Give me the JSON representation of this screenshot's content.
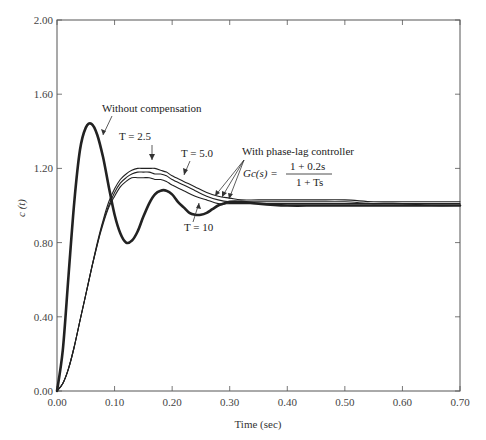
{
  "chart_data": {
    "type": "line",
    "title": "",
    "xlabel": "Time (sec)",
    "ylabel": "c (t)",
    "xlim": [
      0.0,
      0.7
    ],
    "ylim": [
      0.0,
      2.0
    ],
    "grid": false,
    "x_ticks": [
      "0.00",
      "0.10",
      "0.20",
      "0.30",
      "0.40",
      "0.50",
      "0.60",
      "0.70"
    ],
    "y_ticks": [
      "0.00",
      "0.40",
      "0.80",
      "1.20",
      "1.60",
      "2.00"
    ],
    "series": [
      {
        "name": "Without compensation",
        "style": "thick",
        "x": [
          0.0,
          0.01,
          0.02,
          0.03,
          0.04,
          0.05,
          0.06,
          0.07,
          0.08,
          0.09,
          0.1,
          0.11,
          0.12,
          0.13,
          0.14,
          0.15,
          0.16,
          0.17,
          0.18,
          0.19,
          0.2,
          0.21,
          0.22,
          0.23,
          0.24,
          0.25,
          0.26,
          0.27,
          0.28,
          0.29,
          0.3,
          0.32,
          0.35,
          0.4,
          0.45,
          0.5,
          0.55,
          0.6,
          0.65,
          0.7
        ],
        "y": [
          0.0,
          0.22,
          0.62,
          1.02,
          1.3,
          1.42,
          1.44,
          1.38,
          1.26,
          1.1,
          0.95,
          0.85,
          0.8,
          0.81,
          0.86,
          0.94,
          1.01,
          1.06,
          1.08,
          1.08,
          1.06,
          1.02,
          0.99,
          0.96,
          0.95,
          0.95,
          0.96,
          0.98,
          1.0,
          1.01,
          1.02,
          1.02,
          1.01,
          1.0,
          1.0,
          1.0,
          1.0,
          1.0,
          1.0,
          1.0
        ]
      },
      {
        "name": "T = 2.5",
        "style": "thin",
        "x": [
          0.0,
          0.01,
          0.02,
          0.03,
          0.04,
          0.05,
          0.06,
          0.07,
          0.08,
          0.09,
          0.1,
          0.11,
          0.12,
          0.13,
          0.14,
          0.15,
          0.16,
          0.17,
          0.18,
          0.19,
          0.2,
          0.22,
          0.24,
          0.26,
          0.28,
          0.3,
          0.32,
          0.35,
          0.4,
          0.45,
          0.5,
          0.55,
          0.6,
          0.65,
          0.7
        ],
        "y": [
          0.0,
          0.04,
          0.12,
          0.24,
          0.38,
          0.52,
          0.66,
          0.8,
          0.92,
          1.02,
          1.09,
          1.14,
          1.17,
          1.19,
          1.2,
          1.2,
          1.2,
          1.2,
          1.19,
          1.18,
          1.16,
          1.13,
          1.1,
          1.07,
          1.05,
          1.04,
          1.03,
          1.03,
          1.03,
          1.03,
          1.03,
          1.02,
          1.02,
          1.02,
          1.02
        ]
      },
      {
        "name": "T = 5.0",
        "style": "thin",
        "x": [
          0.0,
          0.01,
          0.02,
          0.03,
          0.04,
          0.05,
          0.06,
          0.07,
          0.08,
          0.09,
          0.1,
          0.11,
          0.12,
          0.13,
          0.14,
          0.15,
          0.16,
          0.17,
          0.18,
          0.19,
          0.2,
          0.22,
          0.24,
          0.26,
          0.28,
          0.3,
          0.32,
          0.35,
          0.4,
          0.45,
          0.5,
          0.55,
          0.6,
          0.65,
          0.7
        ],
        "y": [
          0.0,
          0.04,
          0.12,
          0.24,
          0.38,
          0.52,
          0.66,
          0.79,
          0.91,
          1.0,
          1.07,
          1.12,
          1.15,
          1.17,
          1.18,
          1.18,
          1.18,
          1.17,
          1.17,
          1.16,
          1.14,
          1.11,
          1.08,
          1.05,
          1.03,
          1.02,
          1.02,
          1.02,
          1.02,
          1.02,
          1.02,
          1.01,
          1.01,
          1.01,
          1.01
        ]
      },
      {
        "name": "T = 10",
        "style": "thin",
        "x": [
          0.0,
          0.01,
          0.02,
          0.03,
          0.04,
          0.05,
          0.06,
          0.07,
          0.08,
          0.09,
          0.1,
          0.11,
          0.12,
          0.13,
          0.14,
          0.15,
          0.16,
          0.17,
          0.18,
          0.19,
          0.2,
          0.22,
          0.24,
          0.26,
          0.28,
          0.3,
          0.32,
          0.35,
          0.4,
          0.45,
          0.5,
          0.55,
          0.6,
          0.65,
          0.7
        ],
        "y": [
          0.0,
          0.04,
          0.12,
          0.24,
          0.38,
          0.52,
          0.66,
          0.79,
          0.9,
          0.99,
          1.05,
          1.1,
          1.13,
          1.15,
          1.15,
          1.15,
          1.15,
          1.14,
          1.14,
          1.13,
          1.11,
          1.08,
          1.05,
          1.03,
          1.01,
          1.01,
          1.01,
          1.01,
          1.01,
          1.01,
          1.01,
          1.01,
          1.01,
          1.0,
          1.0
        ]
      }
    ],
    "annotations": [
      {
        "text": "Without compensation",
        "x": 0.12,
        "y": 1.51
      },
      {
        "text": "T = 2.5",
        "x": 0.13,
        "y": 1.28
      },
      {
        "text": "T = 5.0",
        "x": 0.19,
        "y": 1.22
      },
      {
        "text": "T = 10",
        "x": 0.2,
        "y": 0.92
      },
      {
        "text": "With phase-lag controller",
        "x": 0.33,
        "y": 1.22
      },
      {
        "text": "Gc(s) = (1 + 0.2s) / (1 + Ts)",
        "x": 0.33,
        "y": 1.14
      }
    ]
  },
  "labels": {
    "xlabel": "Time (sec)",
    "ylabel": "c (t)",
    "without_comp": "Without compensation",
    "t25": "T = 2.5",
    "t50": "T = 5.0",
    "t10": "T = 10",
    "phase_lag": "With phase-lag controller",
    "gc_lhs": "Gc(s) =",
    "gc_num": "1 + 0.2s",
    "gc_den": "1 + Ts"
  }
}
